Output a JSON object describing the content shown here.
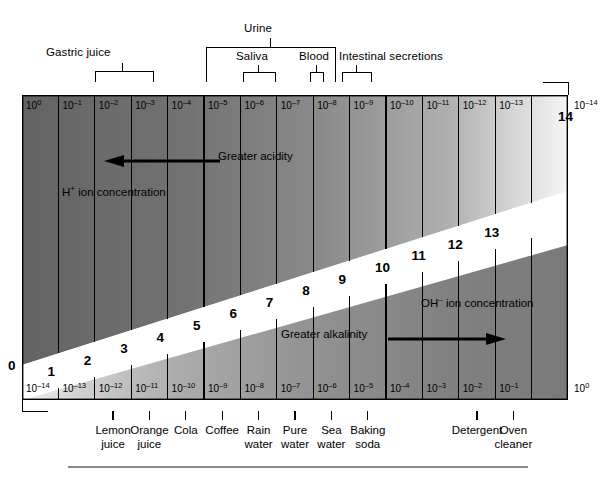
{
  "figure": {
    "type": "ph-scale-diagram",
    "chart_data": {
      "type": "bar",
      "title": "pH scale with hydrogen and hydroxide ion concentrations",
      "xlabel": "pH",
      "ylabel": "",
      "categories": [
        "0",
        "1",
        "2",
        "3",
        "4",
        "5",
        "6",
        "7",
        "8",
        "9",
        "10",
        "11",
        "12",
        "13",
        "14"
      ],
      "values": [
        0,
        1,
        2,
        3,
        4,
        5,
        6,
        7,
        8,
        9,
        10,
        11,
        12,
        13,
        14
      ],
      "xlim": [
        0,
        14
      ],
      "grid": true,
      "legend_position": "none",
      "series": [
        {
          "name": "H+ ion concentration (moles per liter)",
          "values": [
            "10^0",
            "10^-1",
            "10^-2",
            "10^-3",
            "10^-4",
            "10^-5",
            "10^-6",
            "10^-7",
            "10^-8",
            "10^-9",
            "10^-10",
            "10^-11",
            "10^-12",
            "10^-13",
            "10^-14"
          ]
        },
        {
          "name": "OH- ion concentration (moles per liter)",
          "values": [
            "10^-14",
            "10^-13",
            "10^-12",
            "10^-11",
            "10^-10",
            "10^-9",
            "10^-8",
            "10^-7",
            "10^-6",
            "10^-5",
            "10^-4",
            "10^-3",
            "10^-2",
            "10^-1",
            "10^0"
          ]
        }
      ],
      "annotations": [
        "Greater acidity",
        "H+ ion concentration",
        "Greater alkalinity",
        "OH- ion concentration"
      ]
    }
  },
  "top_annotations": [
    {
      "label": "Gastric juice",
      "span_ph": [
        2,
        3
      ]
    },
    {
      "label": "Urine",
      "span_ph": [
        5,
        8
      ]
    },
    {
      "label": "Saliva",
      "span_ph": [
        6,
        7
      ]
    },
    {
      "label": "Blood",
      "span_ph": [
        7,
        7
      ]
    },
    {
      "label": "Intestinal secretions",
      "span_ph": [
        8,
        8
      ]
    }
  ],
  "top_exponents": [
    {
      "base": "10",
      "exp": "0"
    },
    {
      "base": "10",
      "exp": "–1"
    },
    {
      "base": "10",
      "exp": "–2"
    },
    {
      "base": "10",
      "exp": "–3"
    },
    {
      "base": "10",
      "exp": "–4"
    },
    {
      "base": "10",
      "exp": "–5"
    },
    {
      "base": "10",
      "exp": "–6"
    },
    {
      "base": "10",
      "exp": "–7"
    },
    {
      "base": "10",
      "exp": "–8"
    },
    {
      "base": "10",
      "exp": "–9"
    },
    {
      "base": "10",
      "exp": "–10"
    },
    {
      "base": "10",
      "exp": "–11"
    },
    {
      "base": "10",
      "exp": "–12"
    },
    {
      "base": "10",
      "exp": "–13"
    },
    {
      "base": "10",
      "exp": "–14"
    }
  ],
  "bottom_exponents": [
    {
      "base": "10",
      "exp": "–14"
    },
    {
      "base": "10",
      "exp": "–13"
    },
    {
      "base": "10",
      "exp": "–12"
    },
    {
      "base": "10",
      "exp": "–11"
    },
    {
      "base": "10",
      "exp": "–10"
    },
    {
      "base": "10",
      "exp": "–9"
    },
    {
      "base": "10",
      "exp": "–8"
    },
    {
      "base": "10",
      "exp": "–7"
    },
    {
      "base": "10",
      "exp": "–6"
    },
    {
      "base": "10",
      "exp": "–5"
    },
    {
      "base": "10",
      "exp": "–4"
    },
    {
      "base": "10",
      "exp": "–3"
    },
    {
      "base": "10",
      "exp": "–2"
    },
    {
      "base": "10",
      "exp": "–1"
    },
    {
      "base": "10",
      "exp": "0"
    }
  ],
  "ph_numbers": [
    "0",
    "1",
    "2",
    "3",
    "4",
    "5",
    "6",
    "7",
    "8",
    "9",
    "10",
    "11",
    "12",
    "13",
    "14"
  ],
  "inner_labels": {
    "greater_acidity": "Greater acidity",
    "h_ion": "H",
    "h_ion_sup": "+",
    "h_ion_rest": " ion concentration",
    "greater_alkalinity": "Greater alkalinity",
    "oh_ion": "OH",
    "oh_ion_sup": "–",
    "oh_ion_rest": " ion concentration"
  },
  "substances": [
    {
      "name": "Lemon juice",
      "line1": "Lemon",
      "line2": "juice",
      "ph": 2
    },
    {
      "name": "Orange juice",
      "line1": "Orange",
      "line2": "juice",
      "ph": 3
    },
    {
      "name": "Cola",
      "line1": "Cola",
      "line2": "",
      "ph": 4
    },
    {
      "name": "Coffee",
      "line1": "Coffee",
      "line2": "",
      "ph": 5
    },
    {
      "name": "Rain water",
      "line1": "Rain",
      "line2": "water",
      "ph": 6
    },
    {
      "name": "Pure water",
      "line1": "Pure",
      "line2": "water",
      "ph": 7
    },
    {
      "name": "Sea water",
      "line1": "Sea",
      "line2": "water",
      "ph": 8
    },
    {
      "name": "Baking soda",
      "line1": "Baking",
      "line2": "soda",
      "ph": 9
    },
    {
      "name": "Detergent",
      "line1": "Detergent",
      "line2": "",
      "ph": 12
    },
    {
      "name": "Oven cleaner",
      "line1": "Oven",
      "line2": "cleaner",
      "ph": 13
    }
  ],
  "colors": {
    "acid_dark": "#6f6f6f",
    "base_dark": "#757575",
    "neutral_band": "#ffffff",
    "ink": "#000000",
    "rule": "#8a8a8a"
  }
}
